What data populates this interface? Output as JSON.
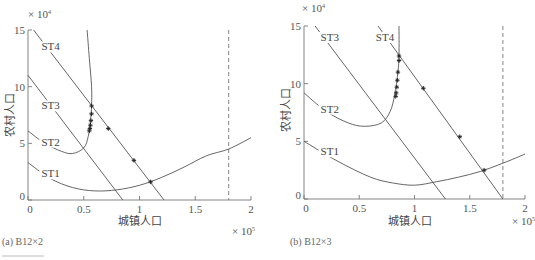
{
  "chart_data": [
    {
      "type": "line",
      "panel": "a",
      "caption": "(a) B12×2",
      "xlabel": "城镇人口",
      "ylabel": "农村人口",
      "x_multiplier": "× 10^5",
      "y_multiplier": "× 10^4",
      "xlim": [
        0,
        2
      ],
      "ylim": [
        0,
        15
      ],
      "xticks": [
        "0",
        "0.5",
        "1",
        "1.5",
        "2"
      ],
      "yticks": [
        "0",
        "5",
        "10",
        "15"
      ],
      "grid": false,
      "dashed_vertical_line_x": 1.8,
      "series": [
        {
          "name": "ST1",
          "kind": "curve",
          "points": [
            [
              0,
              3.3
            ],
            [
              0.2,
              1.9
            ],
            [
              0.4,
              1.1
            ],
            [
              0.6,
              0.8
            ],
            [
              0.8,
              0.9
            ],
            [
              1.0,
              1.3
            ],
            [
              1.2,
              2.0
            ],
            [
              1.4,
              2.9
            ],
            [
              1.6,
              3.9
            ],
            [
              1.8,
              4.5
            ],
            [
              2.0,
              5.5
            ]
          ]
        },
        {
          "name": "ST2",
          "kind": "curve",
          "points": [
            [
              0,
              6.1
            ],
            [
              0.15,
              5.0
            ],
            [
              0.3,
              4.3
            ],
            [
              0.4,
              4.1
            ],
            [
              0.5,
              4.6
            ],
            [
              0.54,
              5.6
            ],
            [
              0.56,
              7.0
            ],
            [
              0.57,
              8.3
            ],
            [
              0.57,
              10
            ],
            [
              0.55,
              12.5
            ],
            [
              0.53,
              15
            ]
          ]
        },
        {
          "name": "ST3",
          "kind": "line",
          "points": [
            [
              0,
              11.0
            ],
            [
              0.85,
              0
            ]
          ]
        },
        {
          "name": "ST4",
          "kind": "line",
          "points": [
            [
              0.05,
              15
            ],
            [
              1.22,
              0
            ]
          ]
        }
      ],
      "markers": [
        [
          0.57,
          8.3
        ],
        [
          0.57,
          7.6
        ],
        [
          0.565,
          7.0
        ],
        [
          0.56,
          6.6
        ],
        [
          0.555,
          6.3
        ],
        [
          0.55,
          6.1
        ],
        [
          0.72,
          6.3
        ],
        [
          0.95,
          3.5
        ],
        [
          1.1,
          1.6
        ]
      ],
      "labels": [
        {
          "text": "ST4",
          "x": 0.12,
          "y": 13.2
        },
        {
          "text": "ST3",
          "x": 0.12,
          "y": 8.0
        },
        {
          "text": "ST2",
          "x": 0.12,
          "y": 4.8
        },
        {
          "text": "ST1",
          "x": 0.12,
          "y": 2.0
        }
      ]
    },
    {
      "type": "line",
      "panel": "b",
      "caption": "(b) B12×3",
      "xlabel": "城镇人口",
      "ylabel": "农村人口",
      "x_multiplier": "× 10^5",
      "y_multiplier": "× 10^4",
      "xlim": [
        0,
        2
      ],
      "ylim": [
        0,
        15
      ],
      "xticks": [
        "0",
        "0.5",
        "1",
        "1.5",
        "2"
      ],
      "yticks": [
        "0",
        "5",
        "10",
        "15"
      ],
      "grid": false,
      "dashed_vertical_line_x": 1.8,
      "series": [
        {
          "name": "ST1",
          "kind": "curve",
          "points": [
            [
              0,
              5.0
            ],
            [
              0.3,
              3.3
            ],
            [
              0.6,
              1.9
            ],
            [
              0.8,
              1.4
            ],
            [
              1.0,
              1.2
            ],
            [
              1.2,
              1.5
            ],
            [
              1.4,
              1.9
            ],
            [
              1.6,
              2.4
            ],
            [
              1.8,
              3.1
            ],
            [
              2.0,
              3.9
            ]
          ]
        },
        {
          "name": "ST2",
          "kind": "curve",
          "points": [
            [
              0,
              9.2
            ],
            [
              0.2,
              7.6
            ],
            [
              0.4,
              6.6
            ],
            [
              0.55,
              6.3
            ],
            [
              0.7,
              6.6
            ],
            [
              0.78,
              7.6
            ],
            [
              0.82,
              9.0
            ],
            [
              0.85,
              11.0
            ],
            [
              0.86,
              12.5
            ],
            [
              0.86,
              15
            ]
          ]
        },
        {
          "name": "ST3",
          "kind": "line",
          "points": [
            [
              0.1,
              15
            ],
            [
              1.28,
              0
            ]
          ]
        },
        {
          "name": "ST4",
          "kind": "line",
          "points": [
            [
              0.67,
              15
            ],
            [
              1.8,
              0
            ]
          ]
        }
      ],
      "markers": [
        [
          0.86,
          12.4
        ],
        [
          0.86,
          12.0
        ],
        [
          0.85,
          11.0
        ],
        [
          0.845,
          10.3
        ],
        [
          0.84,
          9.7
        ],
        [
          0.835,
          9.2
        ],
        [
          0.83,
          8.9
        ],
        [
          1.08,
          9.6
        ],
        [
          1.41,
          5.4
        ],
        [
          1.63,
          2.5
        ]
      ],
      "labels": [
        {
          "text": "ST3",
          "x": 0.15,
          "y": 13.7
        },
        {
          "text": "ST4",
          "x": 0.65,
          "y": 13.7
        },
        {
          "text": "ST2",
          "x": 0.15,
          "y": 7.5
        },
        {
          "text": "ST1",
          "x": 0.15,
          "y": 3.8
        }
      ]
    }
  ]
}
